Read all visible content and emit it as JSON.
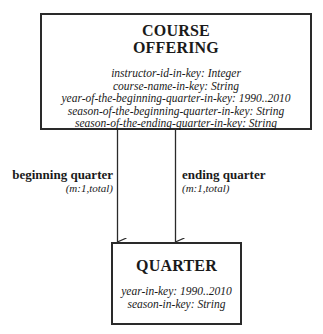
{
  "diagram": {
    "entities": [
      {
        "id": "course_offering",
        "title_lines": [
          "COURSE",
          "OFFERING"
        ],
        "attributes": [
          "instructor-id-in-key: Integer",
          "course-name-in-key: String",
          "year-of-the-beginning-quarter-in-key: 1990..2010",
          "season-of-the-beginning-quarter-in-key: String",
          "season-of-the-ending-quarter-in-key: String"
        ]
      },
      {
        "id": "quarter",
        "title_lines": [
          "QUARTER"
        ],
        "attributes": [
          "year-in-key: 1990..2010",
          "season-in-key: String"
        ]
      }
    ],
    "relationships": [
      {
        "name": "beginning quarter",
        "cardinality": "(m:1,total)",
        "from": "course_offering",
        "to": "quarter"
      },
      {
        "name": "ending quarter",
        "cardinality": "(m:1,total)",
        "from": "course_offering",
        "to": "quarter"
      }
    ],
    "colors": {
      "line": "#2a2a2a",
      "text": "#1a1a1a",
      "background": "#ffffff"
    }
  }
}
